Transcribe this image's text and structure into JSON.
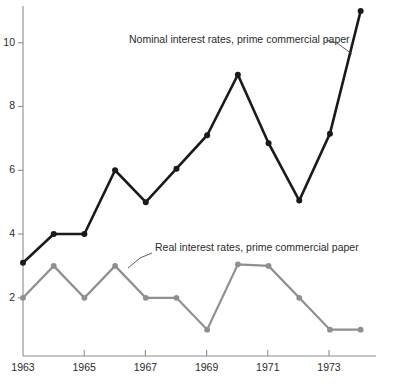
{
  "chart_data": {
    "type": "line",
    "title": "",
    "subtitle": "",
    "xlabel": "",
    "ylabel": "",
    "x": [
      1963,
      1964,
      1965,
      1966,
      1967,
      1968,
      1969,
      1970,
      1971,
      1972,
      1973,
      1974
    ],
    "xlim": [
      1963,
      1974.5
    ],
    "ylim": [
      0,
      11.5
    ],
    "xticks": [
      1963,
      1965,
      1967,
      1969,
      1971,
      1973
    ],
    "xticklabels": [
      "1963",
      "1965",
      "1967",
      "1969",
      "1971",
      "1973"
    ],
    "yticks": [
      2,
      4,
      6,
      8,
      10
    ],
    "yticklabels": [
      "2",
      "4",
      "6",
      "8",
      "10"
    ],
    "grid": false,
    "legend": "inline-annotations",
    "series": [
      {
        "name": "Nominal interest rates, prime commercial paper",
        "color": "#1a1a1a",
        "marker": "circle",
        "values": [
          3.1,
          4.0,
          4.0,
          6.0,
          5.0,
          6.05,
          7.1,
          9.0,
          6.85,
          5.05,
          7.15,
          11.0
        ]
      },
      {
        "name": "Real interest rates, prime commercial paper",
        "color": "#8f8f8f",
        "marker": "circle",
        "values": [
          2.0,
          3.0,
          2.0,
          3.0,
          2.0,
          2.0,
          1.0,
          3.05,
          3.0,
          2.0,
          1.0,
          1.0
        ]
      }
    ],
    "annotations": [
      {
        "text": "Nominal interest rates, prime commercial paper",
        "text_x": 129,
        "text_y": 43,
        "leader": "M 326 40 L 337 43 L 352 54"
      },
      {
        "text": "Real interest rates, prime commercial paper",
        "text_x": 155,
        "text_y": 251,
        "leader": "M 152 253 L 140 258 L 128 268"
      }
    ]
  },
  "axes": {
    "axis_color": "#8c8c8c",
    "y_label_2": "2",
    "y_label_4": "4",
    "y_label_6": "6",
    "y_label_8": "8",
    "y_label_10": "10",
    "x_label_1963": "1963",
    "x_label_1965": "1965",
    "x_label_1967": "1967",
    "x_label_1969": "1969",
    "x_label_1971": "1971",
    "x_label_1973": "1973"
  }
}
